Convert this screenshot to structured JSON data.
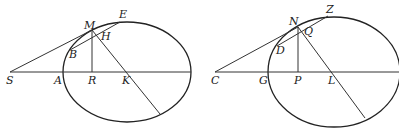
{
  "figures": [
    {
      "name": "left",
      "ellipse": {
        "cx": 127,
        "cy": 72,
        "rx": 64,
        "ry": 50
      },
      "lines": [
        {
          "x1": 10,
          "y1": 72,
          "x2": 191,
          "y2": 72
        },
        {
          "x1": 10,
          "y1": 72,
          "x2": 92,
          "y2": 30
        },
        {
          "x1": 70,
          "y1": 50,
          "x2": 120,
          "y2": 22
        },
        {
          "x1": 92,
          "y1": 30,
          "x2": 92,
          "y2": 72
        },
        {
          "x1": 92,
          "y1": 30,
          "x2": 160,
          "y2": 114
        }
      ],
      "labels": [
        {
          "text": "M",
          "x": 84,
          "y": 29
        },
        {
          "text": "E",
          "x": 119,
          "y": 18
        },
        {
          "text": "H",
          "x": 101,
          "y": 40
        },
        {
          "text": "B",
          "x": 69,
          "y": 58
        },
        {
          "text": "S",
          "x": 6,
          "y": 84
        },
        {
          "text": "A",
          "x": 54,
          "y": 84
        },
        {
          "text": "R",
          "x": 88,
          "y": 84
        },
        {
          "text": "K",
          "x": 122,
          "y": 84
        }
      ]
    },
    {
      "name": "right",
      "ellipse": {
        "cx": 334,
        "cy": 72,
        "rx": 66,
        "ry": 55
      },
      "lines": [
        {
          "x1": 215,
          "y1": 72,
          "x2": 399,
          "y2": 72
        },
        {
          "x1": 215,
          "y1": 72,
          "x2": 298,
          "y2": 27
        },
        {
          "x1": 277,
          "y1": 46,
          "x2": 328,
          "y2": 16
        },
        {
          "x1": 298,
          "y1": 27,
          "x2": 298,
          "y2": 72
        },
        {
          "x1": 298,
          "y1": 27,
          "x2": 365,
          "y2": 118
        }
      ],
      "labels": [
        {
          "text": "N",
          "x": 289,
          "y": 25
        },
        {
          "text": "Z",
          "x": 326,
          "y": 13
        },
        {
          "text": "Q",
          "x": 304,
          "y": 35
        },
        {
          "text": "D",
          "x": 276,
          "y": 54
        },
        {
          "text": "C",
          "x": 211,
          "y": 84
        },
        {
          "text": "G",
          "x": 259,
          "y": 84
        },
        {
          "text": "P",
          "x": 294,
          "y": 84
        },
        {
          "text": "L",
          "x": 328,
          "y": 84
        }
      ]
    }
  ]
}
